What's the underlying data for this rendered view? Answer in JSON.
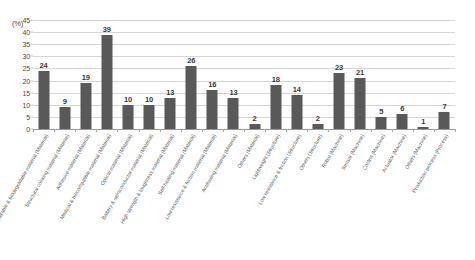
{
  "chart_data": {
    "type": "bar",
    "title": "",
    "subtitle": "",
    "xlabel": "",
    "ylabel": "(%)",
    "ylim": [
      0,
      45
    ],
    "ytick_values": [
      0,
      5,
      10,
      15,
      20,
      25,
      30,
      35,
      40,
      45
    ],
    "ytick_labels": [
      "0",
      "5",
      "10",
      "15",
      "20",
      "25",
      "30",
      "35",
      "40",
      "45"
    ],
    "grid": true,
    "legend": false,
    "legend_position": "none",
    "bar_color": "#595959",
    "gridline_color": "#d6d6d6",
    "axis_color": "#9a9a9a",
    "categories": [
      "Repairable & biodegradable material  (Material)",
      "Structural coloring material  (Material)",
      "Adhesive material  (Material)",
      "Medical & biocompatible material  (Material)",
      "Optical material  (Material)",
      "Battery & semiconductor material  (Material)",
      "High strength & toughness material  (Material)",
      "Self-healing material  (Material)",
      "Low resistance & friction material  (Material)",
      "Antifouling material  (Material)",
      "Others  (Material)",
      "Lightweight  (Structure)",
      "Low resistance & friction  (Structure)",
      "Others  (Structure)",
      "Robot  (Machine)",
      "Sensor  (Machine)",
      "Control  (Machine)",
      "Actuator  (Machine)",
      "Others  (Machine)",
      "Production process  (Process)"
    ],
    "values": [
      24,
      9,
      19,
      39,
      10,
      10,
      13,
      26,
      16,
      13,
      2,
      18,
      14,
      2,
      23,
      21,
      5,
      6,
      1,
      7
    ],
    "data_labels": [
      "24",
      "9",
      "19",
      "39",
      "10",
      "10",
      "13",
      "26",
      "16",
      "13",
      "2",
      "18",
      "14",
      "2",
      "23",
      "21",
      "5",
      "6",
      "1",
      "7"
    ]
  }
}
